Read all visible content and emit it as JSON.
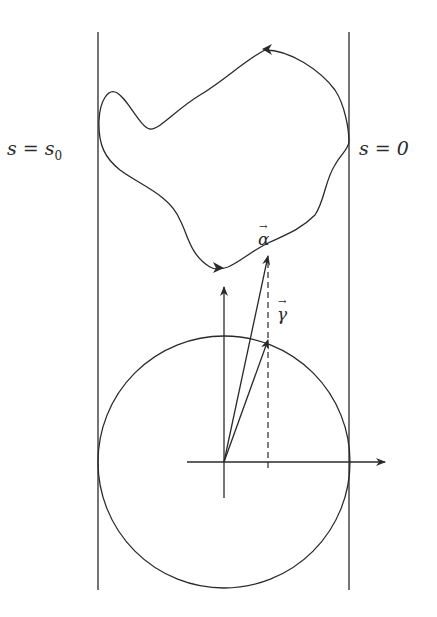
{
  "diagram": {
    "labels": {
      "left_boundary": "s = s",
      "left_boundary_sub": "0",
      "right_boundary": "s = 0",
      "alpha_vector": "α",
      "gamma_vector": "γ"
    },
    "colors": {
      "stroke": "#2a2a2a",
      "background": "#ffffff"
    },
    "elements": [
      "left-vertical-boundary-line",
      "right-vertical-boundary-line",
      "closed-curve-with-direction-arrows",
      "unit-circle",
      "horizontal-axis-arrow",
      "vertical-axis-arrow",
      "vector-alpha",
      "vector-gamma",
      "dashed-projection-line"
    ]
  }
}
